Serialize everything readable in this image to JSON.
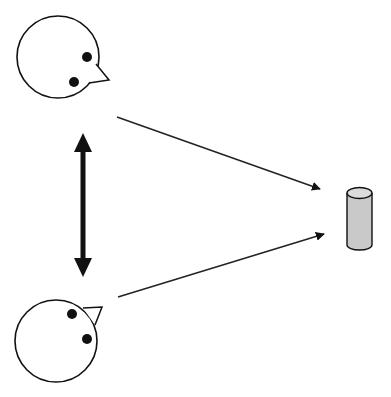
{
  "diagram": {
    "colors": {
      "background": "#ffffff",
      "stroke": "#111111",
      "cylinder_fill": "#c9c9c9",
      "cylinder_top": "#dcdcdc"
    },
    "nodes": [
      {
        "id": "agent-top",
        "type": "head",
        "cx": 60,
        "cy": 85,
        "r": 42,
        "facing": "right-down"
      },
      {
        "id": "agent-bottom",
        "type": "head",
        "cx": 55,
        "cy": 341,
        "r": 42,
        "facing": "right-up"
      },
      {
        "id": "object",
        "type": "cylinder",
        "x": 347,
        "y": 193,
        "w": 25,
        "h": 57
      }
    ],
    "edges": [
      {
        "from": "agent-top",
        "to": "object",
        "style": "thin-arrow"
      },
      {
        "from": "agent-bottom",
        "to": "object",
        "style": "thin-arrow"
      },
      {
        "from": "agent-top",
        "to": "agent-bottom",
        "style": "thick-double-arrow"
      }
    ]
  }
}
